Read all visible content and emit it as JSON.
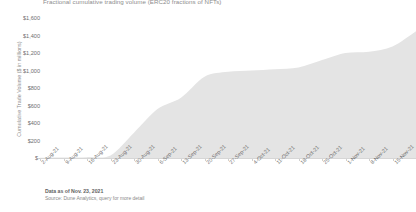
{
  "chart_data": {
    "type": "area",
    "title": "Fractional cumulative trading volume (ERC20 fractions of NFTs)",
    "xlabel": "",
    "ylabel": "Cumulative Trade Volume ($ in millions)",
    "ylim": [
      0,
      1600
    ],
    "ytick_labels": [
      "$1,600",
      "$1,400",
      "$1,200",
      "$1,000",
      "$800",
      "$600",
      "$400",
      "$200",
      "$-"
    ],
    "ytick_values": [
      1600,
      1400,
      1200,
      1000,
      800,
      600,
      400,
      200,
      0
    ],
    "grid": false,
    "legend": "none",
    "series_color": "#e4e4e4",
    "categories": [
      "2-Aug-21",
      "9-Aug-21",
      "16-Aug-21",
      "23-Aug-21",
      "30-Aug-21",
      "6-Sep-21",
      "13-Sep-21",
      "20-Sep-21",
      "27-Sep-21",
      "4-Oct-21",
      "11-Oct-21",
      "18-Oct-21",
      "25-Oct-21",
      "1-Nov-21",
      "8-Nov-21",
      "15-Nov-21",
      "22-Nov-21"
    ],
    "series": [
      {
        "name": "Fractional cumulative trading volume",
        "values": [
          2,
          5,
          10,
          30,
          290,
          560,
          690,
          930,
          985,
          1000,
          1015,
          1035,
          1120,
          1200,
          1215,
          1275,
          1450
        ]
      }
    ]
  },
  "footer": {
    "data_as_of": "Data as of Nov. 23, 2021",
    "source": "Source: Dune Analytics, query for more detail"
  }
}
